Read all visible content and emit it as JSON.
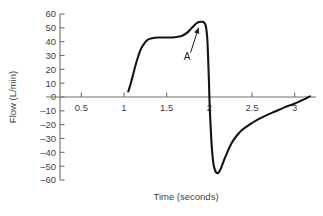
{
  "chart_data": {
    "type": "line",
    "title": "",
    "xlabel": "Time (seconds)",
    "ylabel": "Flow (L/min)",
    "xlim": [
      0.25,
      3.25
    ],
    "ylim": [
      -60,
      60
    ],
    "grid": false,
    "legend": null,
    "x_ticks": [
      0.5,
      1,
      1.5,
      2,
      2.5,
      3
    ],
    "x_tick_labels": [
      "0.5",
      "1",
      "1.5",
      "2",
      "2.5",
      "3"
    ],
    "y_ticks": [
      60,
      50,
      40,
      30,
      20,
      10,
      0,
      -10,
      -20,
      -30,
      -40,
      -50,
      -60
    ],
    "y_tick_labels": [
      "60",
      "50",
      "40",
      "30",
      "20",
      "10",
      "0",
      "–10",
      "–20",
      "–30",
      "–40",
      "–50",
      "–60"
    ],
    "series": [
      {
        "name": "flow",
        "color": "#141414",
        "points": [
          [
            1.05,
            4
          ],
          [
            1.08,
            10
          ],
          [
            1.11,
            17
          ],
          [
            1.14,
            24
          ],
          [
            1.17,
            30
          ],
          [
            1.2,
            35
          ],
          [
            1.24,
            39
          ],
          [
            1.28,
            41.5
          ],
          [
            1.33,
            42.5
          ],
          [
            1.4,
            43
          ],
          [
            1.48,
            43
          ],
          [
            1.56,
            43
          ],
          [
            1.63,
            43.5
          ],
          [
            1.69,
            44.5
          ],
          [
            1.74,
            46.5
          ],
          [
            1.78,
            49
          ],
          [
            1.82,
            51.5
          ],
          [
            1.85,
            53.3
          ],
          [
            1.88,
            54.2
          ],
          [
            1.91,
            54.4
          ],
          [
            1.94,
            53.8
          ],
          [
            1.96,
            51
          ],
          [
            1.975,
            43
          ],
          [
            1.985,
            30
          ],
          [
            1.995,
            12
          ],
          [
            2.005,
            -8
          ],
          [
            2.02,
            -27
          ],
          [
            2.035,
            -41
          ],
          [
            2.05,
            -49
          ],
          [
            2.07,
            -53.5
          ],
          [
            2.09,
            -55
          ],
          [
            2.11,
            -54.5
          ],
          [
            2.14,
            -51
          ],
          [
            2.17,
            -46
          ],
          [
            2.21,
            -40
          ],
          [
            2.26,
            -33.5
          ],
          [
            2.32,
            -28
          ],
          [
            2.39,
            -23.5
          ],
          [
            2.47,
            -20
          ],
          [
            2.56,
            -16.5
          ],
          [
            2.66,
            -13.5
          ],
          [
            2.77,
            -10.5
          ],
          [
            2.88,
            -7.5
          ],
          [
            2.99,
            -5
          ],
          [
            3.08,
            -2.5
          ],
          [
            3.14,
            -0.8
          ],
          [
            3.18,
            0.5
          ]
        ]
      }
    ],
    "annotations": [
      {
        "label": "A",
        "label_x": 1.74,
        "label_y": 27,
        "arrow_from_x": 1.78,
        "arrow_from_y": 32,
        "arrow_to_x": 1.875,
        "arrow_to_y": 50.5
      }
    ]
  }
}
